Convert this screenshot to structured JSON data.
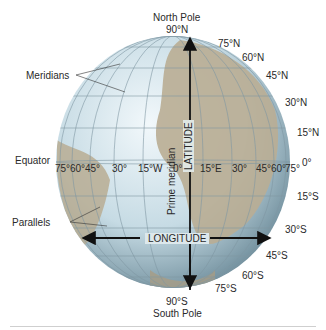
{
  "poles": {
    "north_name": "North Pole",
    "north_deg": "90°N",
    "south_name": "South Pole",
    "south_deg": "90°S"
  },
  "callouts": {
    "meridians": "Meridians",
    "parallels": "Parallels",
    "equator": "Equator",
    "prime_meridian": "Prime meridian"
  },
  "axes": {
    "latitude": "LATITUDE",
    "longitude": "LONGITUDE"
  },
  "latitudes_north": [
    "75°N",
    "60°N",
    "45°N",
    "30°N",
    "15°N"
  ],
  "equator_deg": "0°",
  "latitudes_south": [
    "15°S",
    "30°S",
    "45°S",
    "60°S",
    "75°S"
  ],
  "longitudes": [
    "75°",
    "60°",
    "45°",
    "30°",
    "15°W",
    "0°",
    "15°E",
    "30°",
    "45°",
    "60°",
    "75°"
  ],
  "colors": {
    "ocean": "#c9dde6",
    "land": "#b9ad93",
    "grid": "#7f97a3",
    "arrow": "#111111"
  }
}
